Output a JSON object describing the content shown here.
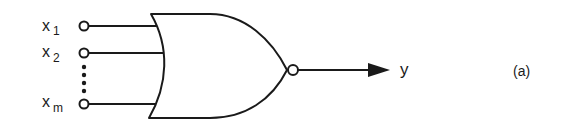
{
  "diagram": {
    "type": "logic-gate",
    "gate": "NOR",
    "figure_label": "(a)",
    "inputs": [
      {
        "name": "x",
        "subscript": "1"
      },
      {
        "name": "x",
        "subscript": "2"
      },
      {
        "name": "x",
        "subscript": "m"
      }
    ],
    "output": {
      "name": "y"
    },
    "ellipsis": "vertical-dots",
    "colors": {
      "stroke": "#1a1a1a",
      "background": "#ffffff"
    }
  }
}
